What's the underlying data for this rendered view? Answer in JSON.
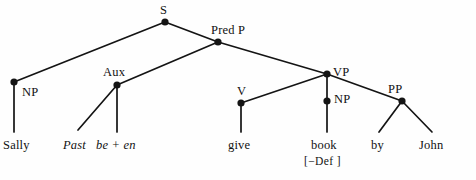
{
  "diagram": {
    "type": "syntax-tree",
    "stroke_color": "#141414",
    "background_color": "#fefefe",
    "node_fill": "#141414"
  },
  "nodes": [
    {
      "id": "S",
      "label": "S",
      "x": 165,
      "y": 22,
      "label_x": 160,
      "label_y": 4,
      "label_align": "above"
    },
    {
      "id": "PredP",
      "label": "Pred P",
      "x": 218,
      "y": 42,
      "label_x": 211,
      "label_y": 24,
      "label_align": "above-right"
    },
    {
      "id": "NP1",
      "label": "NP",
      "x": 14,
      "y": 82,
      "label_x": 22,
      "label_y": 86,
      "label_align": "right"
    },
    {
      "id": "Aux",
      "label": "Aux",
      "x": 117,
      "y": 85,
      "label_x": 103,
      "label_y": 66,
      "label_align": "above-left"
    },
    {
      "id": "VP",
      "label": "VP",
      "x": 327,
      "y": 74,
      "label_x": 333,
      "label_y": 66,
      "label_align": "right"
    },
    {
      "id": "V",
      "label": "V",
      "x": 241,
      "y": 103,
      "label_x": 237,
      "label_y": 85,
      "label_align": "above"
    },
    {
      "id": "NP2",
      "label": "NP",
      "x": 327,
      "y": 101,
      "label_x": 334,
      "label_y": 93,
      "label_align": "right"
    },
    {
      "id": "PP",
      "label": "PP",
      "x": 402,
      "y": 101,
      "label_x": 388,
      "label_y": 83,
      "label_align": "above-left"
    }
  ],
  "edges": [
    {
      "from": "S",
      "to": "NP1",
      "x1": 165,
      "y1": 22,
      "x2": 14,
      "y2": 82
    },
    {
      "from": "S",
      "to": "PredP",
      "x1": 165,
      "y1": 22,
      "x2": 218,
      "y2": 42
    },
    {
      "from": "PredP",
      "to": "Aux",
      "x1": 218,
      "y1": 42,
      "x2": 117,
      "y2": 85
    },
    {
      "from": "PredP",
      "to": "VP",
      "x1": 218,
      "y1": 42,
      "x2": 327,
      "y2": 74
    },
    {
      "from": "Aux",
      "to": "past",
      "x1": 117,
      "y1": 85,
      "x2": 78,
      "y2": 130
    },
    {
      "from": "Aux",
      "to": "been",
      "x1": 117,
      "y1": 85,
      "x2": 117,
      "y2": 132
    },
    {
      "from": "VP",
      "to": "V",
      "x1": 327,
      "y1": 74,
      "x2": 241,
      "y2": 103
    },
    {
      "from": "VP",
      "to": "NP2",
      "x1": 327,
      "y1": 74,
      "x2": 327,
      "y2": 101
    },
    {
      "from": "VP",
      "to": "PP",
      "x1": 327,
      "y1": 74,
      "x2": 402,
      "y2": 101
    },
    {
      "from": "NP1",
      "to": "sally",
      "x1": 14,
      "y1": 82,
      "x2": 14,
      "y2": 132
    },
    {
      "from": "V",
      "to": "give",
      "x1": 241,
      "y1": 103,
      "x2": 241,
      "y2": 132
    },
    {
      "from": "NP2",
      "to": "book",
      "x1": 327,
      "y1": 101,
      "x2": 327,
      "y2": 132
    },
    {
      "from": "PP",
      "to": "by",
      "x1": 402,
      "y1": 101,
      "x2": 379,
      "y2": 132
    },
    {
      "from": "PP",
      "to": "john",
      "x1": 402,
      "y1": 101,
      "x2": 432,
      "y2": 132
    }
  ],
  "terminals": [
    {
      "id": "sally",
      "text": "Sally",
      "x": 3,
      "y": 139,
      "italic": false
    },
    {
      "id": "past",
      "text": "Past",
      "x": 63,
      "y": 139,
      "italic": true
    },
    {
      "id": "been",
      "text": "be + en",
      "x": 96,
      "y": 139,
      "italic": true
    },
    {
      "id": "give",
      "text": "give",
      "x": 228,
      "y": 139,
      "italic": false
    },
    {
      "id": "book",
      "text": "book",
      "x": 311,
      "y": 139,
      "italic": false
    },
    {
      "id": "by",
      "text": "by",
      "x": 371,
      "y": 139,
      "italic": false
    },
    {
      "id": "john",
      "text": "John",
      "x": 419,
      "y": 139,
      "italic": false
    }
  ],
  "features": [
    {
      "id": "book-def",
      "text": "[−Def ]",
      "x": 304,
      "y": 156
    }
  ]
}
